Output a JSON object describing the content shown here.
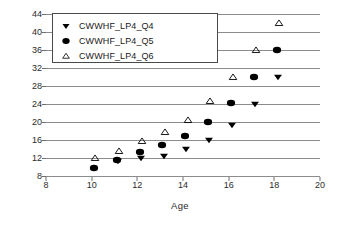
{
  "chart_data": {
    "type": "scatter",
    "title": "",
    "xlabel": "Age",
    "ylabel": "",
    "xlim": [
      8,
      20
    ],
    "ylim": [
      8,
      44
    ],
    "xticks": [
      8,
      10,
      12,
      14,
      16,
      18,
      20
    ],
    "yticks": [
      8,
      12,
      16,
      20,
      24,
      28,
      32,
      36,
      40,
      44
    ],
    "grid": "horizontal",
    "legend_position": "upper-left",
    "series": [
      {
        "name": "CWWHF_LP4_Q4",
        "marker": "filled-down-triangle",
        "color": "#000000",
        "points": [
          {
            "x": 11.15,
            "y": 11.4
          },
          {
            "x": 12.15,
            "y": 11.9
          },
          {
            "x": 13.15,
            "y": 12.5
          },
          {
            "x": 14.15,
            "y": 13.9
          },
          {
            "x": 15.15,
            "y": 16.0
          },
          {
            "x": 16.15,
            "y": 19.4
          },
          {
            "x": 17.15,
            "y": 24.0
          },
          {
            "x": 18.15,
            "y": 30.0
          }
        ]
      },
      {
        "name": "CWWHF_LP4_Q5",
        "marker": "filled-circle",
        "color": "#000000",
        "points": [
          {
            "x": 10.1,
            "y": 9.7
          },
          {
            "x": 11.1,
            "y": 11.5
          },
          {
            "x": 12.1,
            "y": 13.3
          },
          {
            "x": 13.1,
            "y": 15.0
          },
          {
            "x": 14.1,
            "y": 17.0
          },
          {
            "x": 15.1,
            "y": 20.0
          },
          {
            "x": 16.1,
            "y": 24.3
          },
          {
            "x": 17.1,
            "y": 30.0
          },
          {
            "x": 18.1,
            "y": 36.0
          }
        ]
      },
      {
        "name": "CWWHF_LP4_Q6",
        "marker": "open-up-triangle",
        "color": "#000000",
        "points": [
          {
            "x": 10.15,
            "y": 12.1
          },
          {
            "x": 11.2,
            "y": 13.6
          },
          {
            "x": 12.2,
            "y": 15.7
          },
          {
            "x": 13.2,
            "y": 17.8
          },
          {
            "x": 14.2,
            "y": 20.5
          },
          {
            "x": 15.2,
            "y": 24.7
          },
          {
            "x": 16.2,
            "y": 30.0
          },
          {
            "x": 17.2,
            "y": 36.0
          },
          {
            "x": 18.2,
            "y": 42.0
          }
        ]
      }
    ]
  },
  "legend": {
    "items": [
      {
        "label": "CWWHF_LP4_Q4",
        "marker": "filled-down-triangle"
      },
      {
        "label": "CWWHF_LP4_Q5",
        "marker": "filled-circle"
      },
      {
        "label": "CWWHF_LP4_Q6",
        "marker": "open-up-triangle"
      }
    ]
  },
  "axis": {
    "x_title": "Age"
  },
  "colors": {
    "gridline": "#8c8c8c",
    "axis": "#6e6e6e",
    "marker": "#000000",
    "background": "#ffffff",
    "text": "#2b2b2b"
  }
}
